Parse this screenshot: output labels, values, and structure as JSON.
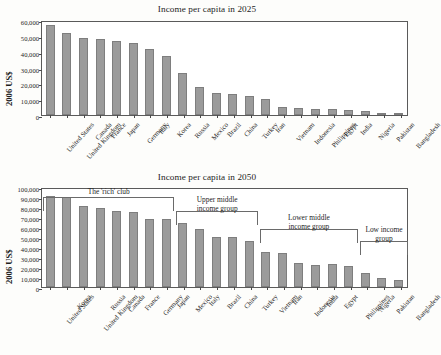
{
  "figure": {
    "ylabel": "2006 US$",
    "bar_color": "#9b9b9b",
    "axis_color": "#5a5a5a"
  },
  "chart_data": [
    {
      "type": "bar",
      "title": "Income per capita in 2025",
      "xlabel": "",
      "ylabel": "2006 US$",
      "ylim": [
        0,
        60000
      ],
      "yticks": [
        "0",
        "10,000",
        "20,000",
        "30,000",
        "40,000",
        "50,000",
        "60,000"
      ],
      "ytick_values": [
        0,
        10000,
        20000,
        30000,
        40000,
        50000,
        60000
      ],
      "grid": false,
      "legend": "none",
      "categories": [
        "United States",
        "United Kingdom",
        "Canada",
        "France",
        "Japan",
        "Germany",
        "Italy",
        "Korea",
        "Russia",
        "Mexico",
        "Brazil",
        "China",
        "Turkey",
        "Iran",
        "Vietnam",
        "Indonesia",
        "Philippines",
        "Egypt",
        "India",
        "Nigeria",
        "Pakistan",
        "Bangladesh"
      ],
      "values": [
        57000,
        52000,
        48500,
        48300,
        46500,
        45200,
        41800,
        37000,
        26500,
        17800,
        13800,
        13300,
        12200,
        9800,
        5300,
        4700,
        4000,
        4000,
        3100,
        2400,
        1500,
        1200
      ]
    },
    {
      "type": "bar",
      "title": "Income per capita in 2050",
      "xlabel": "",
      "ylabel": "2006 US$",
      "ylim": [
        0,
        100000
      ],
      "yticks": [
        "0",
        "10,000",
        "20,000",
        "30,000",
        "40,000",
        "50,000",
        "60,000",
        "70,000",
        "80,000",
        "90,000",
        "100,000"
      ],
      "ytick_values": [
        0,
        10000,
        20000,
        30000,
        40000,
        50000,
        60000,
        70000,
        80000,
        90000,
        100000
      ],
      "grid": false,
      "legend": "none",
      "categories": [
        "United States",
        "Korea",
        "United Kingdom",
        "Russia",
        "Canada",
        "France",
        "Germany",
        "Japan",
        "Mexico",
        "Italy",
        "Brazil",
        "China",
        "Turkey",
        "Vietnam",
        "Iran",
        "Indonesia",
        "India",
        "Egypt",
        "Philippines",
        "Nigeria",
        "Pakistan",
        "Bangladesh"
      ],
      "values": [
        91000,
        90500,
        80800,
        79000,
        75800,
        75500,
        68500,
        68000,
        64000,
        58500,
        50500,
        50500,
        46500,
        35500,
        34500,
        24000,
        22500,
        23000,
        21500,
        14500,
        8800,
        6800
      ],
      "annotations": [
        {
          "label": "The 'rich' club",
          "start_index": 0,
          "end_index": 7
        },
        {
          "label": "Upper middle\nincome group",
          "start_index": 8,
          "end_index": 12
        },
        {
          "label": "Lower middle\nincome group",
          "start_index": 13,
          "end_index": 18
        },
        {
          "label": "Low income\ngroup",
          "start_index": 19,
          "end_index": 21
        }
      ]
    }
  ]
}
